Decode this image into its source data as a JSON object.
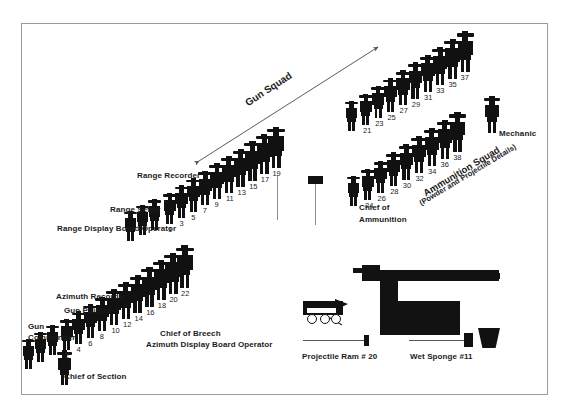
{
  "figure": {
    "frame": {
      "visible": true
    }
  },
  "annotations": {
    "gun_squad_label": "Gun Squad",
    "ammunition_squad_label": "Ammunition Squad",
    "ammunition_squad_sub": "(Powder and Projectile Details)",
    "mechanic_label": "Mechanic",
    "chief_of_ammunition_line1": "Chief of",
    "chief_of_ammunition_line2": "Ammunition"
  },
  "left_role_labels": [
    {
      "id": "range-recorder",
      "text": "Range Recorder"
    },
    {
      "id": "range-setter",
      "text": "Range Setter"
    },
    {
      "id": "range-display-board-operator",
      "text": "Range Display Board Operator"
    },
    {
      "id": "azimuth-recorder",
      "text": "Azimuth Recorder"
    },
    {
      "id": "gun-pointer",
      "text": "Gun Pointer"
    },
    {
      "id": "gun-commander-line1",
      "text": "Gun"
    },
    {
      "id": "gun-commander-line2",
      "text": "Commander"
    },
    {
      "id": "chief-of-breech",
      "text": "Chief of Breech"
    },
    {
      "id": "azimuth-display-board-operator",
      "text": "Azimuth Display Board Operator"
    },
    {
      "id": "chief-of-section",
      "text": "Chief of Section"
    }
  ],
  "equipment_labels": [
    {
      "id": "projectile-ram",
      "text": "Projectile Ram # 20"
    },
    {
      "id": "wet-sponge",
      "text": "Wet Sponge #11"
    }
  ],
  "crew_numbers": {
    "gun_squad_odd_row": [
      1,
      3,
      5,
      7,
      9,
      11,
      13,
      15,
      17,
      19
    ],
    "gun_squad_even_row": [
      2,
      4,
      6,
      8,
      10,
      12,
      14,
      16,
      18,
      20,
      22
    ],
    "ammunition_upper_row": [
      21,
      23,
      25,
      27,
      29,
      31,
      33,
      35,
      37
    ],
    "ammunition_lower_row": [
      24,
      26,
      28,
      30,
      32,
      34,
      36,
      38
    ]
  },
  "chart_data": {
    "type": "diagram",
    "groups": [
      {
        "name": "Gun Squad",
        "rows": [
          {
            "name": "odd-row",
            "members": [
              1,
              3,
              5,
              7,
              9,
              11,
              13,
              15,
              17,
              19
            ]
          },
          {
            "name": "even-row",
            "members": [
              2,
              4,
              6,
              8,
              10,
              12,
              14,
              16,
              18,
              20,
              22
            ]
          }
        ],
        "named_roles": [
          "Range Recorder",
          "Range Setter",
          "Range Display Board Operator",
          "Azimuth Recorder",
          "Gun Pointer",
          "Gun Commander",
          "Chief of Breech",
          "Azimuth Display Board Operator",
          "Chief of Section"
        ]
      },
      {
        "name": "Ammunition Squad",
        "subtitle": "(Powder and Projectile Details)",
        "rows": [
          {
            "name": "upper-row",
            "members": [
              21,
              23,
              25,
              27,
              29,
              31,
              33,
              35,
              37
            ]
          },
          {
            "name": "lower-row",
            "members": [
              24,
              26,
              28,
              30,
              32,
              34,
              36,
              38
            ]
          }
        ],
        "named_roles": [
          "Chief of Ammunition",
          "Mechanic"
        ]
      }
    ],
    "equipment": [
      "Projectile Ram # 20",
      "Wet Sponge #11",
      "Gun",
      "Ammunition cart"
    ]
  },
  "colors": {
    "silhouette": "#111111",
    "frame": "#9a9a9a",
    "text": "#1b1b1b",
    "background": "#ffffff"
  }
}
